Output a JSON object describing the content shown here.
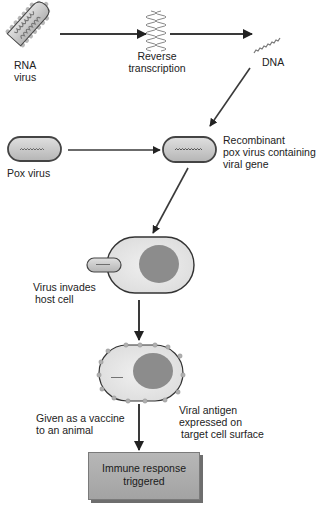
{
  "diagram": {
    "labels": {
      "rna_virus": [
        "RNA",
        "virus"
      ],
      "reverse_transcription": [
        "Reverse",
        "transcription"
      ],
      "dna": "DNA",
      "pox_virus": "Pox virus",
      "recombinant": [
        "Recombinant",
        "pox virus containing",
        "viral gene"
      ],
      "virus_invades": [
        "Virus invades",
        "host cell"
      ],
      "given_as_vaccine": [
        "Given as a vaccine",
        "to an animal"
      ],
      "viral_antigen": [
        "Viral antigen",
        "expressed on",
        "target cell surface"
      ],
      "immune_response": [
        "Immune response",
        "triggered"
      ]
    },
    "nodes": [
      "RNA virus",
      "Reverse transcription",
      "DNA",
      "Pox virus",
      "Recombinant pox virus containing viral gene",
      "Host cell (virus invades)",
      "Cell expressing viral antigen",
      "Immune response triggered"
    ],
    "edges": [
      [
        "RNA virus",
        "Reverse transcription"
      ],
      [
        "Reverse transcription",
        "DNA"
      ],
      [
        "DNA",
        "Recombinant pox virus containing viral gene"
      ],
      [
        "Pox virus",
        "Recombinant pox virus containing viral gene"
      ],
      [
        "Recombinant pox virus containing viral gene",
        "Host cell (virus invades)"
      ],
      [
        "Host cell (virus invades)",
        "Cell expressing viral antigen"
      ],
      [
        "Cell expressing viral antigen",
        "Immune response triggered"
      ]
    ],
    "colors": {
      "arrow": "#3a3a3a",
      "virus_fill": "#c8c8c8",
      "cell_fill": "#e6e6e6",
      "nucleus": "#8c8c8c",
      "box_fill": "#adadad"
    }
  }
}
